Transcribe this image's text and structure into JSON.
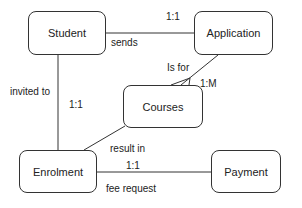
{
  "entities": {
    "student": "Student",
    "application": "Application",
    "courses": "Courses",
    "enrolment": "Enrolment",
    "payment": "Payment"
  },
  "relationships": [
    {
      "from": "Student",
      "to": "Application",
      "label": "sends",
      "cardinality": "1:1"
    },
    {
      "from": "Application",
      "to": "Courses",
      "label": "Is for",
      "cardinality": "1:M"
    },
    {
      "from": "Student",
      "to": "Enrolment",
      "label": "invited to",
      "cardinality": "1:1"
    },
    {
      "from": "Courses",
      "to": "Enrolment",
      "label": "result in",
      "cardinality": ""
    },
    {
      "from": "Enrolment",
      "to": "Payment",
      "label": "fee request",
      "cardinality": "1:1"
    }
  ],
  "colors": {
    "line": "#333333",
    "text": "#222222",
    "background": "#ffffff"
  }
}
